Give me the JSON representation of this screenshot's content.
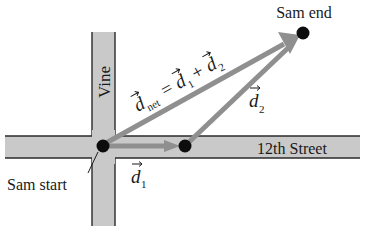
{
  "diagram": {
    "streets": {
      "vertical": "Vine",
      "horizontal": "12th Street"
    },
    "points": {
      "start": "Sam start",
      "end": "Sam end"
    },
    "vectors": {
      "d1": {
        "symbol": "d",
        "subscript": "1"
      },
      "d2": {
        "symbol": "d",
        "subscript": "2"
      },
      "equation": {
        "lhs_symbol": "d",
        "lhs_subscript": "net",
        "equals": "=",
        "term1_symbol": "d",
        "term1_subscript": "1",
        "plus": "+",
        "term2_symbol": "d",
        "term2_subscript": "2"
      }
    },
    "colors": {
      "road_fill": "#c9c9c9",
      "road_edge": "#2a2a2a",
      "vector": "#8f8f8f",
      "dot": "#0d0d0d",
      "text": "#1a1a1a"
    }
  }
}
